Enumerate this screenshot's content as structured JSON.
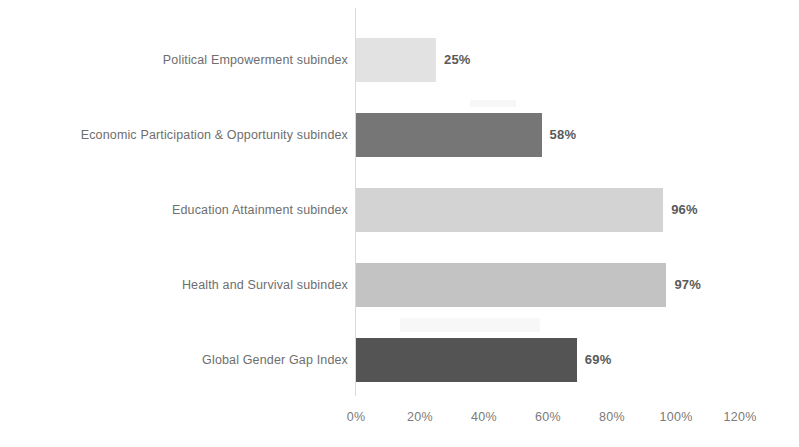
{
  "chart_data": {
    "type": "bar",
    "orientation": "horizontal",
    "title": "",
    "subtitle": "",
    "xlabel": "",
    "ylabel": "",
    "categories": [
      "Political Empowerment subindex",
      "Economic Participation & Opportunity subindex",
      "Education Attainment subindex",
      "Health and Survival subindex",
      "Global Gender Gap Index"
    ],
    "values": [
      25,
      58,
      96,
      97,
      69
    ],
    "data_labels": [
      "25%",
      "58%",
      "96%",
      "97%",
      "69%"
    ],
    "bar_colors": [
      "#e2e2e2",
      "#767676",
      "#d3d3d3",
      "#c3c3c3",
      "#545454"
    ],
    "xlim": [
      0,
      120
    ],
    "xticks": [
      0,
      20,
      40,
      60,
      80,
      100,
      120
    ],
    "xtick_labels": [
      "0%",
      "20%",
      "40%",
      "60%",
      "80%",
      "100%",
      "120%"
    ],
    "grid": false,
    "legend": false,
    "legend_position": "none",
    "axis_line_color": "#d9d9d9",
    "background_color": "#ffffff",
    "label_text_color": "#6e6e6e",
    "value_text_color": "#5a5a5a",
    "tick_text_color": "#7a7a7a"
  },
  "layout": {
    "plot_left_px": 356,
    "axis_line_x_px": 355,
    "pixels_per_100_percent": 320,
    "row_tops_px": [
      38,
      113,
      188,
      263,
      338
    ],
    "bar_height_px": 44,
    "value_axis_top_px": 404,
    "value_label_gap_px": 8
  }
}
